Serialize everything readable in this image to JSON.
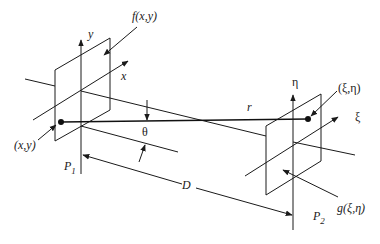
{
  "diagram": {
    "labels": {
      "source_function": "f(x,y)",
      "source_axis_y": "y",
      "source_axis_x": "x",
      "source_point": "(x,y)",
      "source_plane": "P",
      "source_plane_sub": "1",
      "angle": "θ",
      "distance_r": "r",
      "distance_D": "D",
      "obs_axis_eta": "η",
      "obs_axis_xi": "ξ",
      "obs_point": "(ξ,η)",
      "obs_function": "g(ξ,η)",
      "obs_plane": "P",
      "obs_plane_sub": "2"
    },
    "colors": {
      "stroke": "#1a1a1a",
      "background": "#ffffff"
    }
  }
}
